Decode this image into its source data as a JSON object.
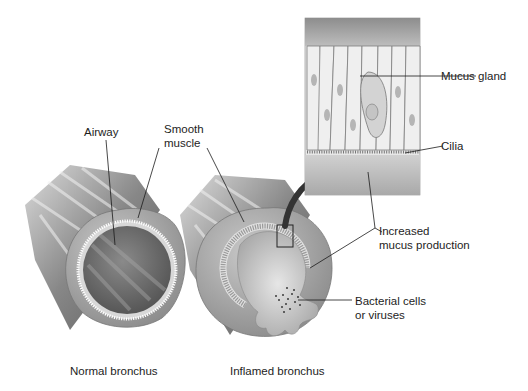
{
  "figure": {
    "labels": {
      "airway": "Airway",
      "smooth_muscle_line1": "Smooth",
      "smooth_muscle_line2": "muscle",
      "mucus_gland": "Mucus gland",
      "cilia": "Cilia",
      "increased_mucus_line1": "Increased",
      "increased_mucus_line2": "mucus production",
      "bacterial_line1": "Bacterial cells",
      "bacterial_line2": "or viruses"
    },
    "captions": {
      "normal": "Normal bronchus",
      "inflamed": "Inflamed bronchus"
    }
  }
}
